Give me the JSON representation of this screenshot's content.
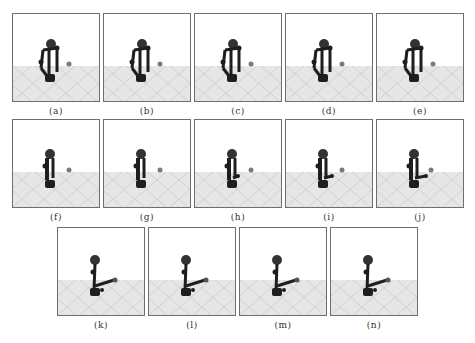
{
  "figure": {
    "panels": [
      {
        "label": "(a)",
        "x": 12,
        "y": 13,
        "arm": "closed-tall",
        "reach": 0
      },
      {
        "label": "(b)",
        "x": 103,
        "y": 13,
        "arm": "closed-tall",
        "reach": 0
      },
      {
        "label": "(c)",
        "x": 194,
        "y": 13,
        "arm": "closed-tall",
        "reach": 0
      },
      {
        "label": "(d)",
        "x": 285,
        "y": 13,
        "arm": "closed-mid",
        "reach": 0
      },
      {
        "label": "(e)",
        "x": 376,
        "y": 13,
        "arm": "closed-mid",
        "reach": 0
      },
      {
        "label": "(f)",
        "x": 12,
        "y": 119,
        "arm": "folded",
        "reach": 0
      },
      {
        "label": "(g)",
        "x": 103,
        "y": 119,
        "arm": "folded",
        "reach": 0
      },
      {
        "label": "(h)",
        "x": 194,
        "y": 119,
        "arm": "folded",
        "reach": 1
      },
      {
        "label": "(i)",
        "x": 285,
        "y": 119,
        "arm": "folded",
        "reach": 2
      },
      {
        "label": "(j)",
        "x": 376,
        "y": 119,
        "arm": "folded",
        "reach": 3
      },
      {
        "label": "(k)",
        "x": 57,
        "y": 227,
        "arm": "extended",
        "reach": 4
      },
      {
        "label": "(l)",
        "x": 148,
        "y": 227,
        "arm": "extended",
        "reach": 5
      },
      {
        "label": "(m)",
        "x": 239,
        "y": 227,
        "arm": "extended",
        "reach": 5
      },
      {
        "label": "(n)",
        "x": 330,
        "y": 227,
        "arm": "extended",
        "reach": 5
      }
    ],
    "colors": {
      "frame_border": "#6e6e6e",
      "floor": "#e6e6e6",
      "grid": "#c4c4c4",
      "robot": "#1e1e1e",
      "ball": "#7a7a7a"
    }
  }
}
